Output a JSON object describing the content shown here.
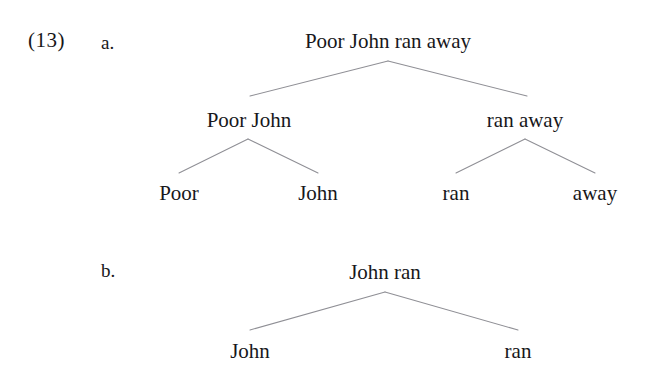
{
  "figure": {
    "example_number": "(13)",
    "background_color": "#ffffff",
    "text_color": "#17171a",
    "branch_color": "#8f8f95"
  },
  "items": {
    "a": {
      "letter": "a."
    },
    "b": {
      "letter": "b."
    }
  },
  "tree_a": {
    "root": {
      "label": "Poor John ran away"
    },
    "level1": [
      {
        "label": "Poor John"
      },
      {
        "label": "ran away"
      }
    ],
    "level2": [
      {
        "label": "Poor"
      },
      {
        "label": "John"
      },
      {
        "label": "ran"
      },
      {
        "label": "away"
      }
    ]
  },
  "tree_b": {
    "root": {
      "label": "John ran"
    },
    "level1": [
      {
        "label": "John"
      },
      {
        "label": "ran"
      }
    ]
  }
}
